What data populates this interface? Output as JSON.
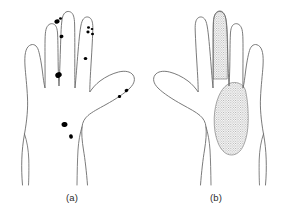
{
  "figure": {
    "background_color": "#ffffff",
    "outline_color": "#6b6b6b",
    "spot_color": "#000000",
    "stipple_color": "#8a8a8a",
    "caption_color": "#2b2b2b"
  },
  "panels": [
    {
      "id": "a",
      "caption": "(a)",
      "view": "hand outline with discrete lesion spots",
      "orientation": "thumb-right",
      "marking_type": "filled-spots",
      "spots": [
        {
          "region": "middle-finger-tip",
          "cx": 57.0,
          "cy": 21.5,
          "rx": 2.6,
          "ry": 2.2,
          "rot": -20
        },
        {
          "region": "middle-finger-tip-upper",
          "cx": 60.5,
          "cy": 18.5,
          "rx": 1.5,
          "ry": 1.3,
          "rot": 0
        },
        {
          "region": "middle-finger-middle",
          "cx": 61.5,
          "cy": 36.5,
          "rx": 2.0,
          "ry": 1.7,
          "rot": -15
        },
        {
          "region": "middle-finger-base",
          "cx": 58.5,
          "cy": 75.0,
          "rx": 3.3,
          "ry": 2.7,
          "rot": -25
        },
        {
          "region": "ring-finger-tip-a",
          "cx": 88.5,
          "cy": 27.5,
          "rx": 1.5,
          "ry": 1.3,
          "rot": 0
        },
        {
          "region": "ring-finger-tip-b",
          "cx": 92.0,
          "cy": 29.0,
          "rx": 1.3,
          "ry": 1.1,
          "rot": 0
        },
        {
          "region": "ring-finger-tip-c",
          "cx": 88.0,
          "cy": 32.0,
          "rx": 1.6,
          "ry": 1.4,
          "rot": 0
        },
        {
          "region": "ring-finger-tip-d",
          "cx": 92.5,
          "cy": 34.0,
          "rx": 1.5,
          "ry": 1.3,
          "rot": 0
        },
        {
          "region": "ring-finger-mid",
          "cx": 85.5,
          "cy": 58.5,
          "rx": 1.8,
          "ry": 1.6,
          "rot": 0
        },
        {
          "region": "thumb-distal",
          "cx": 126.5,
          "cy": 90.5,
          "rx": 1.9,
          "ry": 1.6,
          "rot": -20
        },
        {
          "region": "thumb-proximal",
          "cx": 119.5,
          "cy": 96.5,
          "rx": 1.7,
          "ry": 1.5,
          "rot": -20
        },
        {
          "region": "palm-upper",
          "cx": 64.5,
          "cy": 124.5,
          "rx": 3.0,
          "ry": 2.5,
          "rot": -15
        },
        {
          "region": "palm-lower",
          "cx": 71.0,
          "cy": 136.5,
          "rx": 1.9,
          "ry": 2.3,
          "rot": -10
        }
      ],
      "spot_count": 13
    },
    {
      "id": "b",
      "caption": "(b)",
      "view": "hand outline with stippled shaded areas",
      "orientation": "thumb-right-mirrored",
      "marking_type": "stippled-areas",
      "areas": [
        {
          "region": "middle-finger",
          "label": "middle finger fully stippled"
        },
        {
          "region": "palm-thenar-hypothenar",
          "label": "large palm area stippled"
        }
      ],
      "area_count": 2
    }
  ]
}
